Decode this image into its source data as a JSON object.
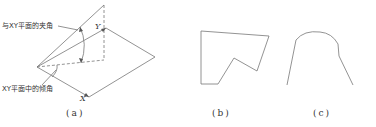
{
  "figures": {
    "a": {
      "caption": "(a)",
      "label_angle_with_plane": "与XY平面的夹角",
      "label_angle_in_plane": "XY平面中的倾角",
      "axis_x": "X",
      "axis_y": "Y"
    },
    "b": {
      "caption": "(b)"
    },
    "c": {
      "caption": "(c)"
    }
  },
  "colors": {
    "stroke": "#777777",
    "text": "#333333"
  }
}
